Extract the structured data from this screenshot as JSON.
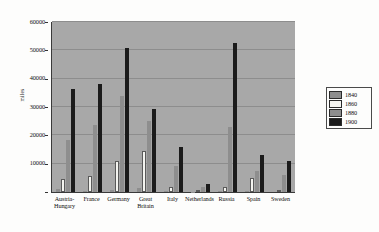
{
  "chart_data": {
    "type": "bar",
    "title": "",
    "subtitle": "",
    "xlabel": "",
    "ylabel": "miles",
    "ylim": [
      0,
      60000
    ],
    "ytick_labels": [
      "0",
      "10000",
      "20000",
      "30000",
      "40000",
      "50000",
      "60000"
    ],
    "ytick_values": [
      0,
      10000,
      20000,
      30000,
      40000,
      50000,
      60000
    ],
    "grid": true,
    "legend_position": "right",
    "categories": [
      "Austria-\nHungary",
      "France",
      "Germany",
      "Great\nBritain",
      "Italy",
      "Netherlands",
      "Russia",
      "Spain",
      "Sweden"
    ],
    "series": [
      {
        "name": "1840",
        "color": "#8e8e8e",
        "values": [
          900,
          500,
          550,
          1350,
          250,
          180,
          400,
          200,
          0
        ]
      },
      {
        "name": "1860",
        "color": "#f4f4f0",
        "values": [
          4500,
          5800,
          11100,
          14600,
          1800,
          350,
          1600,
          5100,
          600
        ]
      },
      {
        "name": "1880",
        "color": "#8e8e8e",
        "values": [
          18500,
          23500,
          33800,
          25100,
          9300,
          1850,
          22900,
          7500,
          5900
        ]
      },
      {
        "name": "1900",
        "color": "#1b1b1b",
        "values": [
          36300,
          38100,
          51000,
          29200,
          16000,
          2800,
          52500,
          13100,
          11100
        ]
      }
    ]
  },
  "legend": {
    "items": [
      {
        "label": "1840",
        "color": "#8e8e8e"
      },
      {
        "label": "1860",
        "color": "#f4f4f0"
      },
      {
        "label": "1880",
        "color": "#8e8e8e"
      },
      {
        "label": "1900",
        "color": "#1b1b1b"
      }
    ]
  },
  "colors": {
    "plot_background": "#a8a8a8",
    "figure_background": "#fdfdfc",
    "gridline": "#8d8d8d",
    "axis": "#3a3a3a",
    "text": "#111111"
  }
}
